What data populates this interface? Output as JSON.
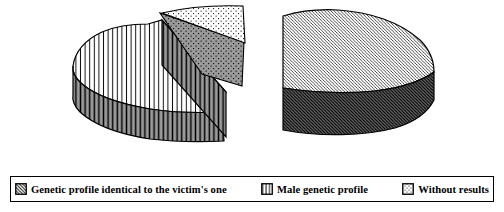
{
  "figure": {
    "background": "#ffffff"
  },
  "legend": {
    "position": "bottom",
    "items": [
      {
        "label": "Genetic profile identical to the victim's one",
        "pattern": "diagonal-hatch"
      },
      {
        "label": "Male genetic profile",
        "pattern": "vertical-lines"
      },
      {
        "label": "Without results",
        "pattern": "dots"
      }
    ]
  },
  "chart_data": {
    "type": "pie",
    "style": "3d-exploded",
    "labels": [
      "Genetic profile identical to the victim's one",
      "Male genetic profile",
      "Without results"
    ],
    "values_pct_estimated": [
      50,
      40,
      10
    ],
    "patterns": [
      "diagonal-hatch",
      "vertical-lines",
      "dots"
    ],
    "title": "",
    "data_labels_shown": false,
    "legend_position": "bottom"
  },
  "colors": {
    "outline": "#000000",
    "top_surface": "#ffffff",
    "vertical_side_gray": "#9a9a9a",
    "diagonal_side_gray": "#6e6e6e",
    "dotted_side_gray": "#9a9a9a"
  }
}
